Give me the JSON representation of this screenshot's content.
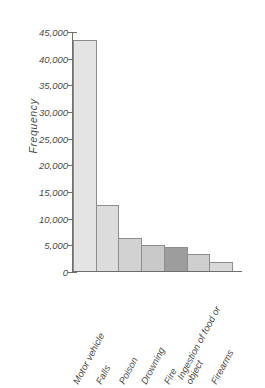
{
  "chart_data": {
    "type": "bar",
    "title": "",
    "xlabel": "",
    "ylabel": "Frequency",
    "categories": [
      "Motor vehicle",
      "Falls",
      "Poison",
      "Drowning",
      "Fire",
      "Ingestion of food or object",
      "Firearms"
    ],
    "values": [
      43500,
      12400,
      6200,
      4900,
      4500,
      3200,
      1700
    ],
    "ylim": [
      0,
      45000
    ],
    "yticks": [
      0,
      5000,
      10000,
      15000,
      20000,
      25000,
      30000,
      35000,
      40000,
      45000
    ],
    "ytick_labels": [
      "0",
      "5,000",
      "10,000",
      "15,000",
      "20,000",
      "25,000",
      "30,000",
      "35,000",
      "40,000",
      "45,000"
    ],
    "grid": false,
    "legend": null,
    "bar_colors": [
      "#e4e4e4",
      "#dcdcdc",
      "#d2d2d2",
      "#c9c9c9",
      "#9d9d9d",
      "#cfcfcf",
      "#d9d9d9"
    ],
    "bar_edge_color": "#8d8d8d",
    "axis_color": "#6e6e6e",
    "text_color": "#4a4a4a",
    "background": "#ffffff"
  }
}
